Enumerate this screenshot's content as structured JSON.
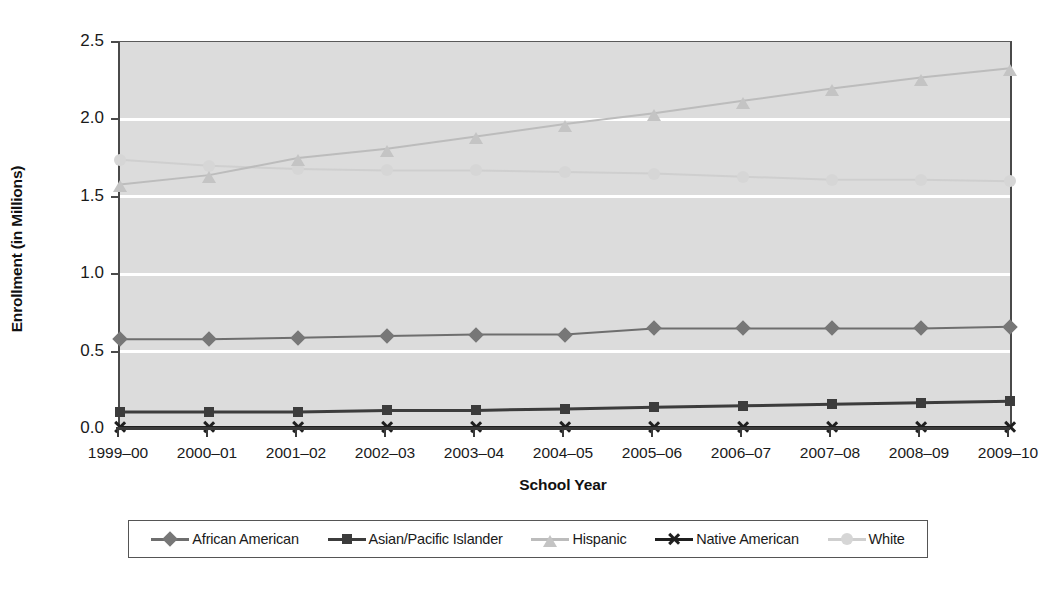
{
  "chart_data": {
    "type": "line",
    "title": "",
    "xlabel": "School Year",
    "ylabel": "Enrollment (in Millions)",
    "categories": [
      "1999–00",
      "2000–01",
      "2001–02",
      "2002–03",
      "2003–04",
      "2004–05",
      "2005–06",
      "2006–07",
      "2007–08",
      "2008–09",
      "2009–10"
    ],
    "ylim": [
      0.0,
      2.5
    ],
    "yticks": [
      0.0,
      0.5,
      1.0,
      1.5,
      2.0,
      2.5
    ],
    "ytick_labels": [
      "0.0",
      "0.5",
      "1.0",
      "1.5",
      "2.0",
      "2.5"
    ],
    "grid": true,
    "grid_color": "#ffffff",
    "plot_background": "#dcdcdc",
    "legend_position": "bottom",
    "series": [
      {
        "name": "African American",
        "marker": "diamond",
        "color": "#777777",
        "line_color": "#6e6e6e",
        "values": [
          0.58,
          0.58,
          0.59,
          0.6,
          0.61,
          0.61,
          0.65,
          0.65,
          0.65,
          0.65,
          0.66
        ]
      },
      {
        "name": "Asian/Pacific Islander",
        "marker": "square",
        "color": "#3c3c3c",
        "line_color": "#3c3c3c",
        "values": [
          0.11,
          0.11,
          0.11,
          0.12,
          0.12,
          0.13,
          0.14,
          0.15,
          0.16,
          0.17,
          0.18
        ]
      },
      {
        "name": "Hispanic",
        "marker": "triangle",
        "color": "#c4c4c4",
        "line_color": "#bcbcbc",
        "values": [
          1.58,
          1.64,
          1.75,
          1.81,
          1.89,
          1.97,
          2.04,
          2.12,
          2.2,
          2.27,
          2.33
        ]
      },
      {
        "name": "Native American",
        "marker": "x",
        "color": "#1f1f1f",
        "line_color": "#1f1f1f",
        "values": [
          0.01,
          0.01,
          0.01,
          0.01,
          0.01,
          0.01,
          0.01,
          0.01,
          0.01,
          0.01,
          0.01
        ]
      },
      {
        "name": "White",
        "marker": "circle",
        "color": "#d6d6d6",
        "line_color": "#cfcfcf",
        "values": [
          1.74,
          1.7,
          1.68,
          1.67,
          1.67,
          1.66,
          1.65,
          1.63,
          1.61,
          1.61,
          1.6
        ]
      }
    ]
  }
}
